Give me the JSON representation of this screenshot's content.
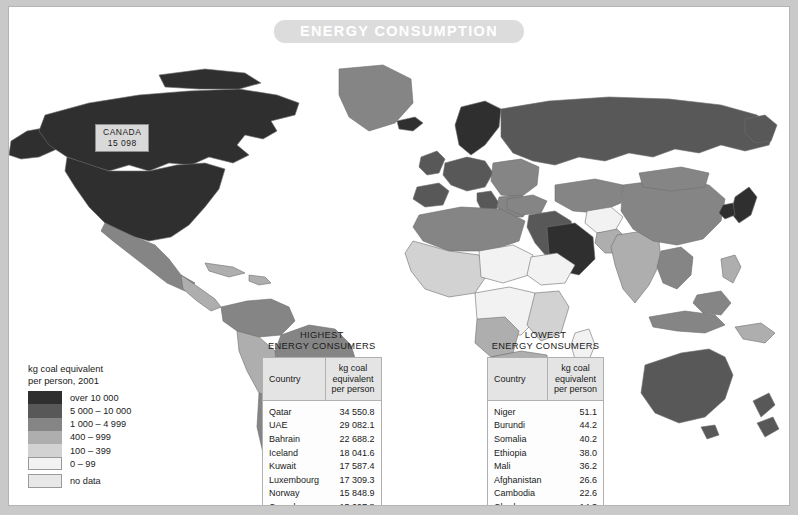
{
  "title": "ENERGY CONSUMPTION",
  "callout": {
    "country": "CANADA",
    "value": "15 098"
  },
  "legend": {
    "title_line1": "kg coal equivalent",
    "title_line2": "per person, 2001",
    "items": [
      {
        "label": "over 10 000",
        "color": "#2f2f2f"
      },
      {
        "label": "5 000 – 10 000",
        "color": "#585858"
      },
      {
        "label": "1 000 – 4 999",
        "color": "#858585"
      },
      {
        "label": "400 – 999",
        "color": "#aeaeae"
      },
      {
        "label": "100 – 399",
        "color": "#d2d2d2"
      },
      {
        "label": "0 – 99",
        "color": "#f2f2f2"
      }
    ],
    "nodata": {
      "label": "no data",
      "color": "#e8e8e8"
    }
  },
  "tables": [
    {
      "caption_line1": "HIGHEST",
      "caption_line2": "ENERGY CONSUMERS",
      "headers": {
        "country": "Country",
        "value_l1": "kg coal",
        "value_l2": "equivalent",
        "value_l3": "per person"
      },
      "rows": [
        {
          "country": "Qatar",
          "value": "34 550.8"
        },
        {
          "country": "UAE",
          "value": "29 082.1"
        },
        {
          "country": "Bahrain",
          "value": "22 688.2"
        },
        {
          "country": "Iceland",
          "value": "18 041.6"
        },
        {
          "country": "Kuwait",
          "value": "17 587.4"
        },
        {
          "country": "Luxembourg",
          "value": "17 309.3"
        },
        {
          "country": "Norway",
          "value": "15 848.9"
        },
        {
          "country": "Canada",
          "value": "15 097.8"
        }
      ]
    },
    {
      "caption_line1": "LOWEST",
      "caption_line2": "ENERGY CONSUMERS",
      "headers": {
        "country": "Country",
        "value_l1": "kg coal",
        "value_l2": "equivalent",
        "value_l3": "per person"
      },
      "rows": [
        {
          "country": "Niger",
          "value": "51.1"
        },
        {
          "country": "Burundi",
          "value": "44.2"
        },
        {
          "country": "Somalia",
          "value": "40.2"
        },
        {
          "country": "Ethiopia",
          "value": "38.0"
        },
        {
          "country": "Mali",
          "value": "36.2"
        },
        {
          "country": "Afghanistan",
          "value": "26.6"
        },
        {
          "country": "Cambodia",
          "value": "22.6"
        },
        {
          "country": "Chad",
          "value": "14.3"
        }
      ]
    }
  ],
  "chart_data": {
    "type": "map",
    "title": "ENERGY CONSUMPTION",
    "unit": "kg coal equivalent per person",
    "year": 2001,
    "classes": [
      "over 10 000",
      "5 000 – 10 000",
      "1 000 – 4 999",
      "400 – 999",
      "100 – 399",
      "0 – 99",
      "no data"
    ],
    "highest_consumers": [
      {
        "country": "Qatar",
        "value": 34550.8
      },
      {
        "country": "UAE",
        "value": 29082.1
      },
      {
        "country": "Bahrain",
        "value": 22688.2
      },
      {
        "country": "Iceland",
        "value": 18041.6
      },
      {
        "country": "Kuwait",
        "value": 17587.4
      },
      {
        "country": "Luxembourg",
        "value": 17309.3
      },
      {
        "country": "Norway",
        "value": 15848.9
      },
      {
        "country": "Canada",
        "value": 15097.8
      }
    ],
    "lowest_consumers": [
      {
        "country": "Niger",
        "value": 51.1
      },
      {
        "country": "Burundi",
        "value": 44.2
      },
      {
        "country": "Somalia",
        "value": 40.2
      },
      {
        "country": "Ethiopia",
        "value": 38.0
      },
      {
        "country": "Mali",
        "value": 36.2
      },
      {
        "country": "Afghanistan",
        "value": 26.6
      },
      {
        "country": "Cambodia",
        "value": 22.6
      },
      {
        "country": "Chad",
        "value": 14.3
      }
    ],
    "labelled_on_map": [
      {
        "country": "CANADA",
        "value": 15098
      }
    ]
  }
}
